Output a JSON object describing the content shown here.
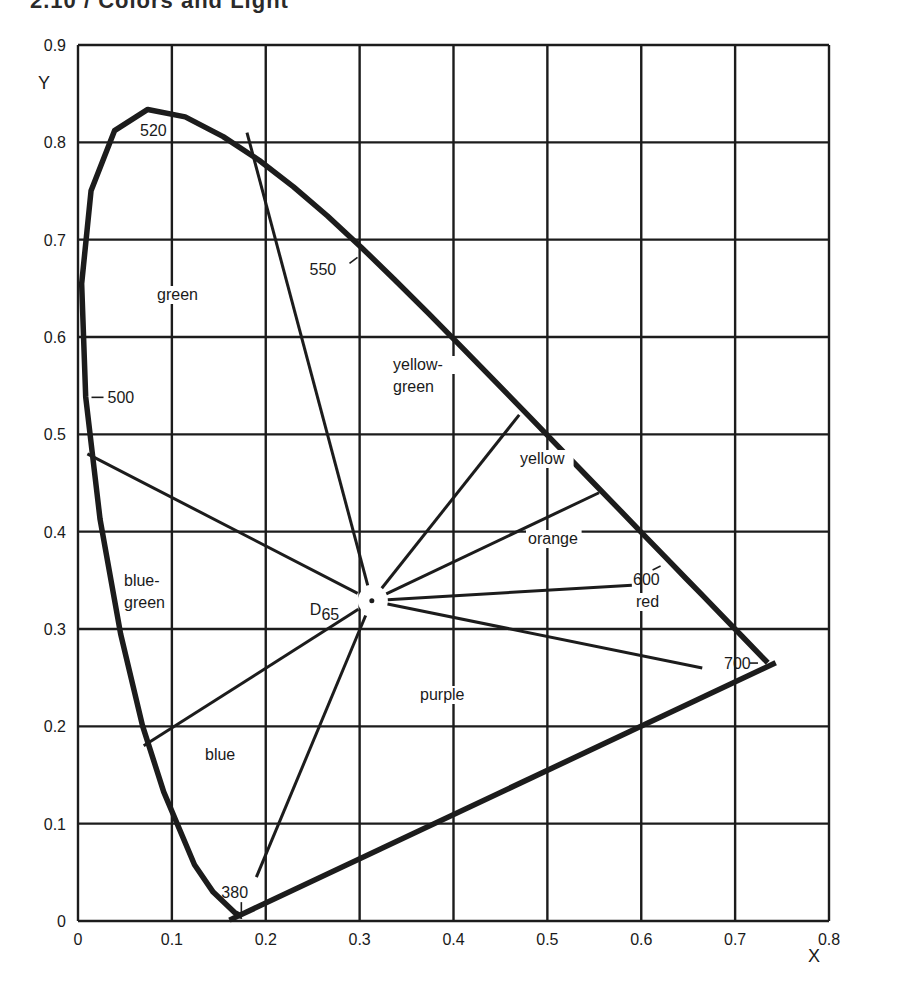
{
  "page": {
    "header": "2.10 / Colors and Light"
  },
  "chart_data": {
    "type": "diagram",
    "xlabel": "X",
    "ylabel": "Y",
    "xlim": [
      0,
      0.8
    ],
    "ylim": [
      0,
      0.9
    ],
    "x_ticks": [
      "0",
      "0.1",
      "0.2",
      "0.3",
      "0.4",
      "0.5",
      "0.6",
      "0.7",
      "0.8"
    ],
    "y_ticks": [
      "0",
      "0.1",
      "0.2",
      "0.3",
      "0.4",
      "0.5",
      "0.6",
      "0.7",
      "0.8",
      "0.9"
    ],
    "grid": true,
    "white_point": {
      "label": "D65",
      "x": 0.313,
      "y": 0.329
    },
    "spectral_locus": [
      [
        0.1741,
        0.005
      ],
      [
        0.1738,
        0.0049
      ],
      [
        0.1666,
        0.0089
      ],
      [
        0.144,
        0.0297
      ],
      [
        0.1241,
        0.0578
      ],
      [
        0.0913,
        0.1327
      ],
      [
        0.0687,
        0.2007
      ],
      [
        0.0454,
        0.295
      ],
      [
        0.0235,
        0.4127
      ],
      [
        0.0082,
        0.5384
      ],
      [
        0.0039,
        0.6548
      ],
      [
        0.0139,
        0.7502
      ],
      [
        0.0389,
        0.812
      ],
      [
        0.0743,
        0.8338
      ],
      [
        0.1142,
        0.8262
      ],
      [
        0.1547,
        0.8059
      ],
      [
        0.1929,
        0.7816
      ],
      [
        0.2296,
        0.7543
      ],
      [
        0.2658,
        0.7243
      ],
      [
        0.3016,
        0.6923
      ],
      [
        0.3373,
        0.6589
      ],
      [
        0.3731,
        0.6245
      ],
      [
        0.4087,
        0.5896
      ],
      [
        0.4441,
        0.5547
      ],
      [
        0.4788,
        0.5202
      ],
      [
        0.5125,
        0.4866
      ],
      [
        0.5448,
        0.4544
      ],
      [
        0.5752,
        0.4242
      ],
      [
        0.6029,
        0.3965
      ],
      [
        0.627,
        0.3725
      ],
      [
        0.6482,
        0.3514
      ],
      [
        0.6658,
        0.334
      ],
      [
        0.6915,
        0.3083
      ],
      [
        0.7079,
        0.292
      ],
      [
        0.7347,
        0.2653
      ]
    ],
    "wavelength_labels": [
      {
        "label": "380",
        "x": 0.174,
        "y": 0.005
      },
      {
        "label": "500",
        "x": 0.008,
        "y": 0.538
      },
      {
        "label": "520",
        "x": 0.074,
        "y": 0.834
      },
      {
        "label": "550",
        "x": 0.302,
        "y": 0.692
      },
      {
        "label": "600",
        "x": 0.627,
        "y": 0.373
      },
      {
        "label": "700",
        "x": 0.735,
        "y": 0.265
      }
    ],
    "region_labels": [
      {
        "label": "green",
        "x": 0.1,
        "y": 0.625
      },
      {
        "label": "yellow-green",
        "x": 0.34,
        "y": 0.56
      },
      {
        "label": "yellow",
        "x": 0.48,
        "y": 0.47
      },
      {
        "label": "orange",
        "x": 0.49,
        "y": 0.38
      },
      {
        "label": "red",
        "x": 0.58,
        "y": 0.305
      },
      {
        "label": "blue-green",
        "x": 0.06,
        "y": 0.34
      },
      {
        "label": "purple",
        "x": 0.38,
        "y": 0.225
      },
      {
        "label": "blue",
        "x": 0.14,
        "y": 0.175
      }
    ],
    "boundary_lines_from_white": [
      {
        "to": [
          0.01,
          0.48
        ]
      },
      {
        "to": [
          0.18,
          0.81
        ]
      },
      {
        "to": [
          0.47,
          0.52
        ]
      },
      {
        "to": [
          0.555,
          0.44
        ]
      },
      {
        "to": [
          0.59,
          0.345
        ]
      },
      {
        "to": [
          0.665,
          0.26
        ]
      },
      {
        "to": [
          0.07,
          0.18
        ]
      },
      {
        "to": [
          0.19,
          0.045
        ]
      }
    ]
  }
}
